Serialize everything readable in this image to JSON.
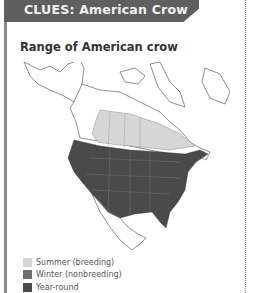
{
  "header": {
    "label": "CLUES: American Crow",
    "color": "#5f5f5f"
  },
  "figure": {
    "title": "Range of American crow",
    "legend": [
      {
        "label": "Summer (breeding)",
        "color": "#d6d6d6"
      },
      {
        "label": "Winter (nonbreeding)",
        "color": "#6e6e6e"
      },
      {
        "label": "Year-round",
        "color": "#4a4a4a"
      }
    ]
  }
}
